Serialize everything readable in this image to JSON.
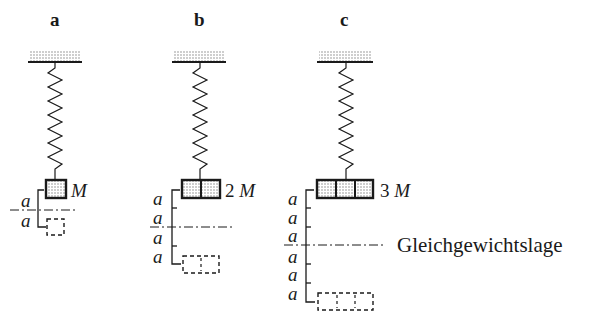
{
  "colors": {
    "ink": "#1a1a1a",
    "stipple": "#9a9a9a"
  },
  "panels": [
    {
      "id": "a",
      "label": "a",
      "mass_factor": "",
      "mass_symbol": "M",
      "segments": 1,
      "distance_labels": [
        "a",
        "a"
      ]
    },
    {
      "id": "b",
      "label": "b",
      "mass_factor": "2",
      "mass_symbol": "M",
      "segments": 2,
      "distance_labels": [
        "a",
        "a",
        "a",
        "a"
      ]
    },
    {
      "id": "c",
      "label": "c",
      "mass_factor": "3",
      "mass_symbol": "M",
      "segments": 3,
      "distance_labels": [
        "a",
        "a",
        "a",
        "a",
        "a",
        "a"
      ]
    }
  ],
  "equilibrium_label": "Gleichgewichtslage",
  "icons": {
    "ceiling": "hatched-ceiling-icon",
    "spring": "spring-icon",
    "mass": "mass-block-icon",
    "ghost": "dashed-mass-icon"
  }
}
